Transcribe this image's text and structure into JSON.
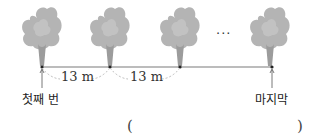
{
  "diagram": {
    "trees_count_visible": 4,
    "spacing_labels": [
      "13 m",
      "13 m"
    ],
    "ellipsis": "···",
    "first_label": "첫째 번",
    "last_label": "마지막",
    "answer_open": "(",
    "answer_close": ")"
  },
  "colors": {
    "foliage": "#b4b4b4",
    "trunk": "#9c9c9c",
    "ground_line": "#7a7a7a",
    "dashed": "#bbbbbb"
  }
}
